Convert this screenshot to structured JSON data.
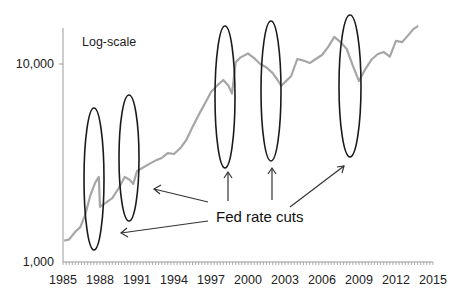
{
  "chart_data": {
    "type": "line",
    "title": "",
    "xlabel": "",
    "ylabel": "",
    "y_scale": "log",
    "scale_note": "Log-scale",
    "xlim": [
      1985,
      2015
    ],
    "ylim": [
      1000,
      20000
    ],
    "x_ticks": [
      "1985",
      "1988",
      "1991",
      "1994",
      "1997",
      "2000",
      "2003",
      "2006",
      "2009",
      "2012",
      "2015"
    ],
    "y_ticks": [
      "1,000",
      "10,000"
    ],
    "grid": false,
    "legend": null,
    "series": [
      {
        "name": "Index (log scale)",
        "color": "#a6a6a6",
        "x": [
          1985.1,
          1985.5,
          1986.0,
          1986.4,
          1986.8,
          1987.2,
          1987.6,
          1987.9,
          1988.0,
          1988.5,
          1989.0,
          1989.5,
          1990.0,
          1990.4,
          1990.7,
          1991.0,
          1991.5,
          1992.0,
          1992.5,
          1993.0,
          1993.5,
          1994.0,
          1994.5,
          1995.0,
          1995.5,
          1996.0,
          1996.5,
          1997.0,
          1997.5,
          1998.0,
          1998.4,
          1998.7,
          1999.0,
          1999.4,
          2000.0,
          2000.5,
          2001.0,
          2001.5,
          2002.0,
          2002.4,
          2002.7,
          2003.0,
          2003.5,
          2004.0,
          2004.5,
          2005.0,
          2005.5,
          2006.0,
          2006.5,
          2007.0,
          2007.5,
          2008.0,
          2008.5,
          2009.0,
          2009.5,
          2010.0,
          2010.5,
          2011.0,
          2011.5,
          2012.0,
          2012.5,
          2013.0,
          2013.4,
          2013.8
        ],
        "values": [
          1280,
          1300,
          1420,
          1500,
          1730,
          2150,
          2510,
          2690,
          1900,
          2000,
          2100,
          2350,
          2690,
          2600,
          2480,
          2880,
          3000,
          3130,
          3250,
          3350,
          3550,
          3510,
          3750,
          4130,
          4800,
          5530,
          6300,
          7210,
          7800,
          8300,
          7800,
          7100,
          10200,
          10800,
          11300,
          10700,
          10000,
          9600,
          9000,
          8300,
          7760,
          8100,
          8700,
          10600,
          10400,
          10100,
          10600,
          11100,
          12200,
          13700,
          12900,
          11900,
          9800,
          8200,
          9400,
          10500,
          11200,
          11500,
          10900,
          13100,
          12900,
          14000,
          15000,
          15600
        ]
      }
    ],
    "annotations": {
      "label": "Fed rate cuts",
      "circled_years": [
        1987.6,
        1990.5,
        1998.5,
        2002.5,
        2009.0
      ]
    }
  }
}
